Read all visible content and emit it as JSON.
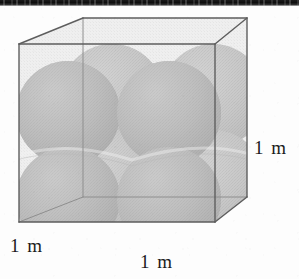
{
  "figure": {
    "kind": "geometry-diagram",
    "title": "",
    "caption": ""
  },
  "labels": {
    "height": "1 m",
    "depth": "1 m",
    "width": "1 m"
  },
  "colors": {
    "sphere_fill": "#b0b0b0",
    "sphere_fill_light": "#c4c4c4",
    "sphere_shadow": "#9a9a9a",
    "cube_face": "#ededed",
    "cube_edge": "#5e5e5e",
    "cube_edge_back": "#8e8e8e",
    "text": "#1b1b1b",
    "background": "#fdfdfd",
    "scan_band": "#141414"
  },
  "geometry": {
    "cube": {
      "front_top_left": [
        19,
        44
      ],
      "front_top_right": [
        215,
        44
      ],
      "front_bottom_left": [
        19,
        222
      ],
      "front_bottom_right": [
        215,
        222
      ],
      "back_top_left": [
        83,
        18
      ],
      "back_top_right": [
        247,
        18
      ],
      "back_bottom_left": [
        83,
        197
      ],
      "back_bottom_right": [
        247,
        197
      ]
    },
    "sphere_count": 8,
    "sphere_arrangement": "2 x 2 x 2",
    "sphere_radius_px": 52
  }
}
